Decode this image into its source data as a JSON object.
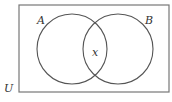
{
  "diagram": {
    "type": "venn",
    "universe_label": "U",
    "sets": [
      {
        "name": "A",
        "label": "A"
      },
      {
        "name": "B",
        "label": "B"
      }
    ],
    "intersection_label": "x",
    "colors": {
      "stroke": "#555555",
      "border": "#777777",
      "text": "#333333",
      "background": "#ffffff"
    }
  }
}
